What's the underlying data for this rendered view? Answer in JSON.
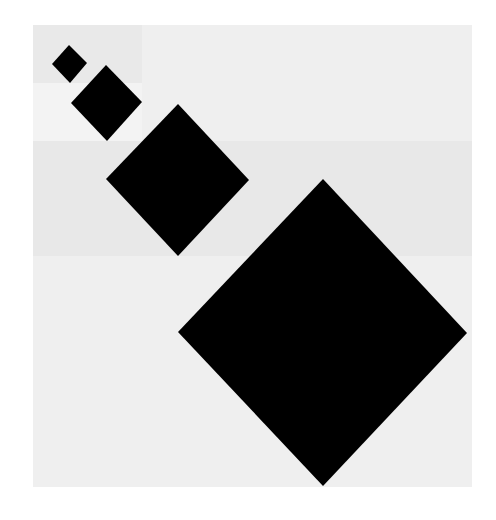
{
  "artwork": {
    "canvas": {
      "width": 496,
      "height": 520,
      "background": "#ffffff"
    },
    "panel": {
      "x": 33,
      "y": 25,
      "width": 439,
      "height": 462,
      "color": "#ededed"
    },
    "blocks": [
      {
        "name": "block-top-left",
        "x": 33,
        "y": 25,
        "width": 109,
        "height": 58,
        "color": "#e9e9e9"
      },
      {
        "name": "block-left-mid",
        "x": 33,
        "y": 83,
        "width": 109,
        "height": 58,
        "color": "#f3f3f3"
      },
      {
        "name": "block-top-right",
        "x": 142,
        "y": 25,
        "width": 330,
        "height": 116,
        "color": "#efefef"
      },
      {
        "name": "block-middle-band",
        "x": 33,
        "y": 141,
        "width": 439,
        "height": 115,
        "color": "#e8e8e8"
      },
      {
        "name": "block-lower",
        "x": 33,
        "y": 256,
        "width": 439,
        "height": 231,
        "color": "#efefef"
      }
    ],
    "diamonds": [
      {
        "name": "diamond-1",
        "size_rank": 1,
        "color": "#000000",
        "points": [
          [
            69,
            45
          ],
          [
            87,
            63
          ],
          [
            70,
            83
          ],
          [
            52,
            64
          ]
        ]
      },
      {
        "name": "diamond-2",
        "size_rank": 2,
        "color": "#000000",
        "points": [
          [
            106,
            65
          ],
          [
            142,
            102
          ],
          [
            107,
            141
          ],
          [
            71,
            103
          ]
        ]
      },
      {
        "name": "diamond-3",
        "size_rank": 3,
        "color": "#000000",
        "points": [
          [
            178,
            104
          ],
          [
            249,
            180
          ],
          [
            178,
            256
          ],
          [
            106,
            179
          ]
        ]
      },
      {
        "name": "diamond-4",
        "size_rank": 4,
        "color": "#000000",
        "points": [
          [
            323,
            179
          ],
          [
            467,
            333
          ],
          [
            323,
            486
          ],
          [
            178,
            332
          ]
        ]
      }
    ]
  }
}
